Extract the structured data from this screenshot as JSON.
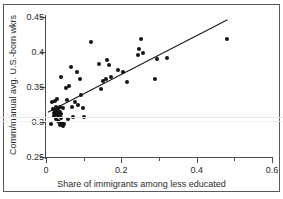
{
  "figure": {
    "background_color": "#ffffff",
    "frame_color": "#5a5a5a",
    "marker_color": "#121212",
    "line_color": "#1a1a1a",
    "artifact_color": "#e9e9e6"
  },
  "chart_data": {
    "type": "scatter",
    "title": "",
    "xlabel": "Share of immigrants among less educated",
    "ylabel": "Comm/manual avg. U.S.-born wkrs",
    "xlim": [
      0,
      0.6
    ],
    "ylim": [
      0.25,
      0.45
    ],
    "grid": false,
    "legend": null,
    "xticks": [
      0,
      0.2,
      0.4,
      0.6
    ],
    "xticklabels": [
      "0",
      "0.2",
      "0.4",
      "0.6"
    ],
    "xminorticks": [
      0.1,
      0.3,
      0.5
    ],
    "yticks": [
      0.25,
      0.3,
      0.35,
      0.4,
      0.45
    ],
    "yticklabels": [
      "0.25",
      "0.3",
      "0.35",
      "0.4",
      "0.45"
    ],
    "yminorticks": [],
    "points": [
      {
        "x": 0.013,
        "y": 0.297
      },
      {
        "x": 0.016,
        "y": 0.328
      },
      {
        "x": 0.018,
        "y": 0.318
      },
      {
        "x": 0.02,
        "y": 0.313
      },
      {
        "x": 0.021,
        "y": 0.308
      },
      {
        "x": 0.023,
        "y": 0.33
      },
      {
        "x": 0.024,
        "y": 0.316
      },
      {
        "x": 0.025,
        "y": 0.312
      },
      {
        "x": 0.026,
        "y": 0.305
      },
      {
        "x": 0.027,
        "y": 0.322
      },
      {
        "x": 0.028,
        "y": 0.315
      },
      {
        "x": 0.029,
        "y": 0.31
      },
      {
        "x": 0.03,
        "y": 0.333
      },
      {
        "x": 0.031,
        "y": 0.302
      },
      {
        "x": 0.032,
        "y": 0.318
      },
      {
        "x": 0.033,
        "y": 0.313
      },
      {
        "x": 0.034,
        "y": 0.308
      },
      {
        "x": 0.035,
        "y": 0.3
      },
      {
        "x": 0.036,
        "y": 0.321
      },
      {
        "x": 0.037,
        "y": 0.296
      },
      {
        "x": 0.038,
        "y": 0.315
      },
      {
        "x": 0.039,
        "y": 0.311
      },
      {
        "x": 0.04,
        "y": 0.364
      },
      {
        "x": 0.041,
        "y": 0.306
      },
      {
        "x": 0.043,
        "y": 0.299
      },
      {
        "x": 0.045,
        "y": 0.294
      },
      {
        "x": 0.046,
        "y": 0.32
      },
      {
        "x": 0.049,
        "y": 0.297
      },
      {
        "x": 0.052,
        "y": 0.348
      },
      {
        "x": 0.055,
        "y": 0.332
      },
      {
        "x": 0.058,
        "y": 0.305
      },
      {
        "x": 0.062,
        "y": 0.352
      },
      {
        "x": 0.066,
        "y": 0.379
      },
      {
        "x": 0.068,
        "y": 0.322
      },
      {
        "x": 0.072,
        "y": 0.307
      },
      {
        "x": 0.078,
        "y": 0.328
      },
      {
        "x": 0.083,
        "y": 0.371
      },
      {
        "x": 0.086,
        "y": 0.325
      },
      {
        "x": 0.09,
        "y": 0.361
      },
      {
        "x": 0.093,
        "y": 0.338
      },
      {
        "x": 0.097,
        "y": 0.32
      },
      {
        "x": 0.1,
        "y": 0.307
      },
      {
        "x": 0.12,
        "y": 0.414
      },
      {
        "x": 0.14,
        "y": 0.383
      },
      {
        "x": 0.145,
        "y": 0.347
      },
      {
        "x": 0.152,
        "y": 0.358
      },
      {
        "x": 0.16,
        "y": 0.362
      },
      {
        "x": 0.163,
        "y": 0.388
      },
      {
        "x": 0.168,
        "y": 0.382
      },
      {
        "x": 0.172,
        "y": 0.364
      },
      {
        "x": 0.19,
        "y": 0.375
      },
      {
        "x": 0.205,
        "y": 0.371
      },
      {
        "x": 0.215,
        "y": 0.357
      },
      {
        "x": 0.243,
        "y": 0.396
      },
      {
        "x": 0.248,
        "y": 0.405
      },
      {
        "x": 0.252,
        "y": 0.419
      },
      {
        "x": 0.258,
        "y": 0.399
      },
      {
        "x": 0.29,
        "y": 0.361
      },
      {
        "x": 0.295,
        "y": 0.39
      },
      {
        "x": 0.322,
        "y": 0.391
      },
      {
        "x": 0.48,
        "y": 0.418
      }
    ],
    "fit_line": {
      "type": "linear-fit",
      "x_start": 0.005,
      "y_start": 0.314,
      "x_end": 0.482,
      "y_end": 0.446
    }
  }
}
